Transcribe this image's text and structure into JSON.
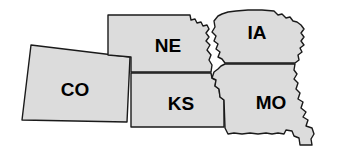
{
  "map": {
    "title": "Midwest States Outline Map",
    "background_color": "#ffffff",
    "state_fill_color": "#dcdcdc",
    "state_stroke_color": "#1a1a1a",
    "label_color": "#000000",
    "stroke_width": 1.4,
    "label_font_size": 19,
    "states": [
      {
        "code": "CO",
        "name": "Colorado",
        "label_x": 75,
        "label_y": 91,
        "path": "M 31 45 L 130 57 L 127 122 L 22 120 Z"
      },
      {
        "code": "NE",
        "name": "Nebraska",
        "label_x": 168,
        "label_y": 47,
        "path": "M 108 15 L 190 15 L 191 20 L 195 19 L 197 23 L 201 22 L 203 26 L 207 25 L 209 29 L 206 33 L 209 37 L 206 41 L 210 45 L 207 50 L 211 55 L 209 60 L 212 65 L 211 72 L 131 72 L 131 57 L 108 55 Z"
      },
      {
        "code": "KS",
        "name": "Kansas",
        "label_x": 181,
        "label_y": 105,
        "path": "M 131 73 L 211 73 L 212 78 L 216 80 L 215 86 L 219 89 L 220 97 L 224 100 L 224 127 L 131 127 Z"
      },
      {
        "code": "IA",
        "name": "Iowa",
        "label_x": 257,
        "label_y": 34,
        "path": "M 214 21 L 218 16 L 222 14 L 228 12 L 236 11 L 248 10 L 262 10 L 274 11 L 278 15 L 282 14 L 286 18 L 290 17 L 293 21 L 297 22 L 301 25 L 304 29 L 301 33 L 304 37 L 301 41 L 304 45 L 300 48 L 302 52 L 298 55 L 299 60 L 295 63 L 225 63 L 222 59 L 218 57 L 220 52 L 216 49 L 218 44 L 214 41 L 216 36 L 212 32 L 215 27 Z"
      },
      {
        "code": "MO",
        "name": "Missouri",
        "label_x": 271,
        "label_y": 104,
        "path": "M 225 64 L 295 64 L 294 70 L 297 74 L 294 79 L 298 83 L 296 89 L 300 93 L 298 99 L 303 102 L 301 108 L 306 112 L 303 117 L 308 120 L 306 126 L 312 128 L 314 134 L 311 139 L 312 145 L 300 145 L 299 138 L 294 136 L 292 131 L 286 130 L 284 134 L 278 133 L 272 134 L 266 133 L 258 134 L 250 133 L 242 134 L 234 133 L 228 134 L 225 128 L 224 100 L 220 97 L 219 89 L 215 86 L 216 80 L 212 78 L 214 72 L 218 69 L 221 66 Z"
      }
    ]
  }
}
